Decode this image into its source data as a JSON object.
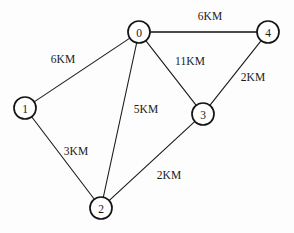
{
  "figure": {
    "background_color": "#fdfdfd",
    "stroke_color": "#1a1a1a",
    "node_fill_color": "#ffffff"
  },
  "chart_data": {
    "type": "diagram",
    "diagram_kind": "undirected-weighted-graph",
    "title": "",
    "node_radius": 11,
    "nodes": [
      {
        "id": "0",
        "label": "0",
        "x": 139,
        "y": 32
      },
      {
        "id": "1",
        "label": "1",
        "x": 25,
        "y": 108
      },
      {
        "id": "2",
        "label": "2",
        "x": 101,
        "y": 208
      },
      {
        "id": "3",
        "label": "3",
        "x": 203,
        "y": 114
      },
      {
        "id": "4",
        "label": "4",
        "x": 268,
        "y": 32
      }
    ],
    "edges": [
      {
        "from": "0",
        "to": "4",
        "weight": 6,
        "label": "6KM",
        "label_x": 210,
        "label_y": 16,
        "emphasis": "thick"
      },
      {
        "from": "0",
        "to": "1",
        "weight": 6,
        "label": "6KM",
        "label_x": 63,
        "label_y": 59,
        "emphasis": "normal"
      },
      {
        "from": "0",
        "to": "3",
        "weight": 11,
        "label": "11KM",
        "label_x": 190,
        "label_y": 61,
        "emphasis": "normal"
      },
      {
        "from": "0",
        "to": "2",
        "weight": 5,
        "label": "5KM",
        "label_x": 146,
        "label_y": 109,
        "emphasis": "normal"
      },
      {
        "from": "3",
        "to": "4",
        "weight": 2,
        "label": "2KM",
        "label_x": 253,
        "label_y": 77,
        "emphasis": "normal"
      },
      {
        "from": "1",
        "to": "2",
        "weight": 3,
        "label": "3KM",
        "label_x": 76,
        "label_y": 151,
        "emphasis": "normal"
      },
      {
        "from": "2",
        "to": "3",
        "weight": 2,
        "label": "2KM",
        "label_x": 169,
        "label_y": 175,
        "emphasis": "normal"
      }
    ],
    "units": "KM",
    "edge_count": 7,
    "node_count": 5
  }
}
